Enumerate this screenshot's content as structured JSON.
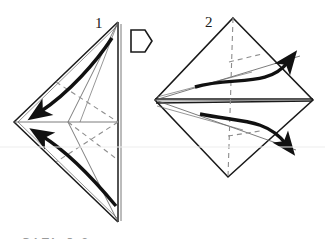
{
  "figure": {
    "background_color": "#ffffff",
    "ink_color": "#1a1a1a",
    "thin_line_color": "#4a4a4a",
    "dashed_line_color": "#8a8a8a",
    "arrow_color": "#111111"
  },
  "steps": [
    {
      "number": "1",
      "number_x": 95,
      "number_y": 28,
      "shape": "triangle-kite",
      "description": "Folded triangular flap with valley folds; two curved arrows fold flaps to the left"
    },
    {
      "number": "2",
      "number_x": 205,
      "number_y": 27,
      "shape": "diamond",
      "description": "Diamond shape opened; two curved arrows swing flaps outward to the right"
    }
  ],
  "progress_marker": {
    "name": "next-step-arrow",
    "label": "",
    "x": 130,
    "y": 30,
    "width": 22,
    "height": 22
  },
  "caption": {
    "text": "STEP 5-6",
    "visible_fragment": "partially cropped at bottom edge"
  },
  "arrows": {
    "step1": [
      {
        "name": "fold-arrow-upper-left",
        "direction": "left"
      },
      {
        "name": "fold-arrow-lower-left",
        "direction": "left"
      }
    ],
    "step2": [
      {
        "name": "fold-arrow-upper-right",
        "direction": "up-right"
      },
      {
        "name": "fold-arrow-lower-right",
        "direction": "down-right"
      }
    ]
  }
}
